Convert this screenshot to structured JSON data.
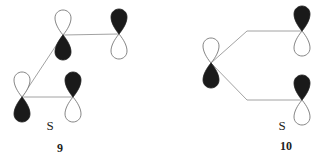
{
  "figures": [
    {
      "id": "9",
      "number_label": "9",
      "sym_label": "S",
      "orbitals": [
        {
          "name": "orbital-a",
          "x": 63,
          "y": 35,
          "top": "white",
          "bottom": "black"
        },
        {
          "name": "orbital-b",
          "x": 119,
          "y": 34,
          "top": "black",
          "bottom": "white"
        },
        {
          "name": "orbital-c",
          "x": 22,
          "y": 97,
          "top": "white",
          "bottom": "black"
        },
        {
          "name": "orbital-d",
          "x": 73,
          "y": 97,
          "top": "black",
          "bottom": "white"
        }
      ],
      "bonds": [
        {
          "from": "orbital-a",
          "to": "orbital-b"
        },
        {
          "from": "orbital-a",
          "to": "orbital-c"
        },
        {
          "from": "orbital-c",
          "to": "orbital-d"
        }
      ]
    },
    {
      "id": "10",
      "number_label": "10",
      "sym_label": "S",
      "orbitals": [
        {
          "name": "orbital-e",
          "x": 211,
          "y": 63,
          "top": "white",
          "bottom": "black"
        },
        {
          "name": "orbital-f",
          "x": 302,
          "y": 31,
          "top": "black",
          "bottom": "white"
        },
        {
          "name": "orbital-g",
          "x": 302,
          "y": 100,
          "top": "black",
          "bottom": "white"
        }
      ],
      "bonds": [
        {
          "from": "orbital-e",
          "to": "orbital-f"
        },
        {
          "from": "orbital-e",
          "to": "orbital-g"
        }
      ]
    }
  ],
  "colors": {
    "lobe_fill": "#1a1a1a",
    "line": "#8a8a8a",
    "outline": "#666666"
  }
}
